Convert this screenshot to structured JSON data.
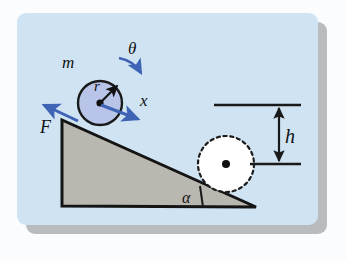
{
  "figure": {
    "kind": "physics-diagram",
    "panel": {
      "background_color": "#cfe3f2",
      "shadow_color": "#b9bcbe",
      "page_background": "#fbfcfd"
    },
    "colors": {
      "stroke": "#141414",
      "incline_fill": "#b8b7b0",
      "cylinder_fill": "#b8c4e8",
      "cylinder_stroke": "#1a1a1a",
      "arrow_blue": "#3f63b5",
      "arrow_black": "#111111",
      "dashed_circle_fill": "#ffffff",
      "dashed_circle_stroke": "#1c1c1c"
    },
    "labels": {
      "mass": "m",
      "radius": "r",
      "angle_rotation": "θ",
      "displacement": "x",
      "force": "F",
      "height": "h",
      "incline_angle": "α"
    },
    "elements": {
      "incline_triangle": "right triangle with vertical left side, horizontal base and hypotenuse sloping down to the right",
      "rolling_cylinder": "shaded blue circle resting on the upper part of the incline",
      "final_cylinder": "dashed outline circle at the bottom of the incline",
      "height_dimension": "double-headed vertical arrow between two horizontal reference lines",
      "force_arrow": "straight arrow pointing up-left along the incline",
      "rotation_arrow": "curved arrow indicating clockwise rotation",
      "displacement_arrow": "straight arrow from the cylinder centre pointing down-slope",
      "radius_arrow": "straight arrow from the cylinder centre to the rim"
    }
  }
}
